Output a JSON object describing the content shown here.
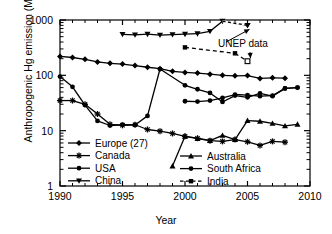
{
  "chart_data": {
    "type": "line",
    "title": "",
    "xlabel": "Year",
    "ylabel": "Anthropogenic Hg emission (Mg)",
    "xlim": [
      1990,
      2010
    ],
    "ylim": [
      1,
      1000
    ],
    "yscale": "log",
    "grid": false,
    "legend_position": "inside-bottom-left and inside-bottom-right",
    "xticks": [
      "1990",
      "1995",
      "2000",
      "2005",
      "2010"
    ],
    "yticks": [
      "1",
      "10",
      "100",
      "1000"
    ],
    "annotations": [
      {
        "text": "UNEP data",
        "note": "arrows point to China 2005 point and India 2005 point"
      }
    ],
    "series": [
      {
        "name": "Europe (27)",
        "marker": "diamond",
        "line": "solid",
        "x": [
          1990,
          1991,
          1992,
          1993,
          1994,
          1995,
          1996,
          1997,
          1998,
          1999,
          2000,
          2001,
          2002,
          2003,
          2004,
          2005,
          2006,
          2007,
          2008
        ],
        "values": [
          220,
          210,
          195,
          175,
          165,
          160,
          150,
          140,
          132,
          118,
          113,
          110,
          105,
          100,
          98,
          99,
          88,
          90,
          89
        ]
      },
      {
        "name": "Canada",
        "marker": "star",
        "line": "solid",
        "x": [
          1990,
          1991,
          1992,
          1993,
          1994,
          1995,
          1996,
          1997,
          1998,
          1999,
          2000,
          2001,
          2002,
          2003,
          2004,
          2005,
          2006,
          2007,
          2008
        ],
        "values": [
          35,
          35,
          30,
          20,
          13,
          12.5,
          12.8,
          10.5,
          9.8,
          8.9,
          7.9,
          7.3,
          6.6,
          6.4,
          6.9,
          6.3,
          5.4,
          6.4,
          6.2
        ]
      },
      {
        "name": "USA",
        "marker": "circle",
        "line": "solid",
        "x": [
          1990,
          1991,
          1992,
          1993,
          1994,
          1995,
          1996,
          1997,
          1998,
          1999,
          2000,
          2001,
          2002,
          2003,
          2004,
          2005,
          2006,
          2007,
          2008,
          2009
        ],
        "values": [
          95,
          62,
          29,
          15,
          12.4,
          12.8,
          12.7,
          18.5,
          130,
          null,
          66,
          56,
          48,
          33,
          43,
          40,
          47,
          42,
          58,
          60
        ]
      },
      {
        "name": "China",
        "marker": "down-triangle",
        "line": "solid",
        "x": [
          1995,
          1996,
          1997,
          1998,
          1999,
          2000,
          2001,
          2002,
          2003,
          2005
        ],
        "values": [
          550,
          540,
          555,
          535,
          545,
          555,
          565,
          625,
          950,
          800
        ]
      },
      {
        "name": "Australia",
        "marker": "up-triangle",
        "line": "solid",
        "x": [
          1999,
          2000,
          2001,
          2002,
          2003,
          2004,
          2005,
          2006,
          2007,
          2008,
          2009
        ],
        "values": [
          2.3,
          7.9,
          7.2,
          6.6,
          8.2,
          6.9,
          15.2,
          14.8,
          13.5,
          12.2,
          13.0
        ]
      },
      {
        "name": "South Africa",
        "marker": "circle",
        "line": "solid",
        "x": [
          2000,
          2001,
          2002,
          2003,
          2004,
          2005,
          2006,
          2007,
          2008,
          2009
        ],
        "values": [
          34,
          33.5,
          35,
          39,
          45,
          44,
          42,
          43,
          58,
          60
        ]
      },
      {
        "name": "India",
        "marker": "square",
        "line": "dashed",
        "x": [
          2000,
          2004,
          2005
        ],
        "values": [
          320,
          250,
          180
        ]
      }
    ]
  },
  "legend_left": [
    {
      "label": "Europe (27)",
      "marker": "diamond",
      "line": "solid"
    },
    {
      "label": "Canada",
      "marker": "star",
      "line": "solid"
    },
    {
      "label": "USA",
      "marker": "circle",
      "line": "solid"
    },
    {
      "label": "China",
      "marker": "down-triangle",
      "line": "solid"
    }
  ],
  "legend_right": [
    {
      "label": "Australia",
      "marker": "up-triangle",
      "line": "solid"
    },
    {
      "label": "South Africa",
      "marker": "circle",
      "line": "solid"
    },
    {
      "label": "India",
      "marker": "square",
      "line": "dashed"
    }
  ],
  "axis": {
    "x_title": "Year",
    "y_title": "Anthropogenic Hg emission (Mg)",
    "x_ticks": [
      "1990",
      "1995",
      "2000",
      "2005",
      "2010"
    ],
    "y_ticks": [
      "1000",
      "100",
      "10",
      "1"
    ]
  },
  "annotation": {
    "unep_label": "UNEP data"
  },
  "colors": {
    "foreground": "#000000",
    "background": "#ffffff"
  }
}
